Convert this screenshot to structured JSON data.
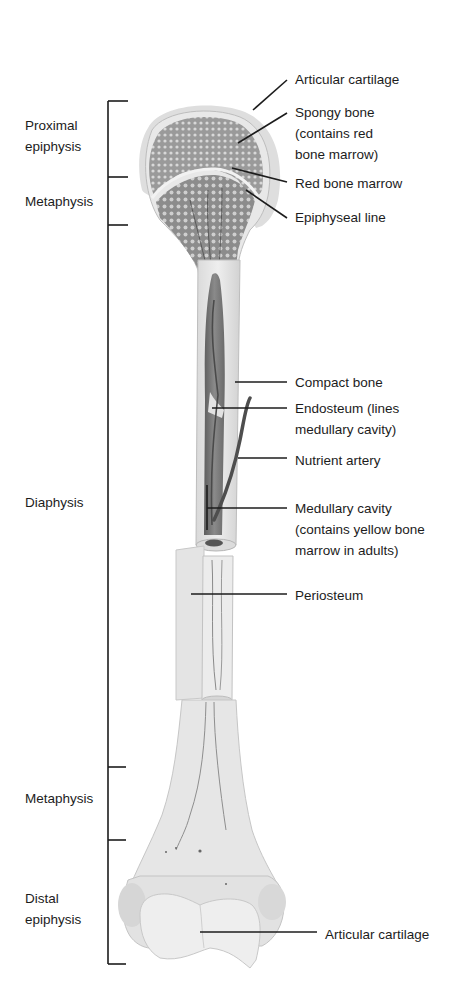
{
  "figure": {
    "colors": {
      "ink": "#1c1c1c",
      "bone_light": "#e6e6e6",
      "bone_mid": "#cfcfcf",
      "spongy": "#8a8a8a",
      "cartilage": "#dcdcdc",
      "cavity": "#6e6e6e",
      "artery": "#555555"
    }
  },
  "regions": [
    {
      "id": "proximal-epiphysis",
      "lines": [
        "Proximal",
        "epiphysis"
      ]
    },
    {
      "id": "proximal-metaphysis",
      "lines": [
        "Metaphysis"
      ]
    },
    {
      "id": "diaphysis",
      "lines": [
        "Diaphysis"
      ]
    },
    {
      "id": "distal-metaphysis",
      "lines": [
        "Metaphysis"
      ]
    },
    {
      "id": "distal-epiphysis",
      "lines": [
        "Distal",
        "epiphysis"
      ]
    }
  ],
  "callouts": [
    {
      "id": "articular-cartilage-top",
      "lines": [
        "Articular cartilage"
      ]
    },
    {
      "id": "spongy-bone",
      "lines": [
        "Spongy  bone",
        "(contains red",
        "bone marrow)"
      ]
    },
    {
      "id": "red-bone-marrow",
      "lines": [
        "Red bone marrow"
      ]
    },
    {
      "id": "epiphyseal-line",
      "lines": [
        "Epiphyseal line"
      ]
    },
    {
      "id": "compact-bone",
      "lines": [
        "Compact bone"
      ]
    },
    {
      "id": "endosteum",
      "lines": [
        "Endosteum (lines",
        "medullary cavity)"
      ]
    },
    {
      "id": "nutrient-artery",
      "lines": [
        "Nutrient artery"
      ]
    },
    {
      "id": "medullary-cavity",
      "lines": [
        "Medullary cavity",
        "(contains yellow bone",
        "marrow in adults)"
      ]
    },
    {
      "id": "periosteum",
      "lines": [
        "Periosteum"
      ]
    },
    {
      "id": "articular-cartilage-bottom",
      "lines": [
        "Articular cartilage"
      ]
    }
  ]
}
